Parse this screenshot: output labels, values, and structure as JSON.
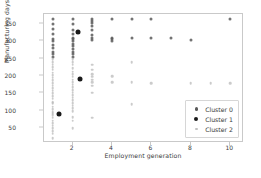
{
  "chart_data": {
    "type": "scatter",
    "title": "",
    "xlabel": "Employment generation",
    "ylabel": "Manufacturing days",
    "xlim": [
      0.55,
      10.7
    ],
    "ylim": [
      8,
      378
    ],
    "xticks": [
      2,
      4,
      6,
      8,
      10
    ],
    "yticks": [
      50,
      100,
      150,
      200,
      250,
      300,
      350
    ],
    "grid": false,
    "legend_position": "lower right",
    "legend_entries": [
      "Cluster 0",
      "Cluster 1",
      "Cluster 2"
    ],
    "series": [
      {
        "name": "Cluster 0",
        "color": "#5a5a5a",
        "marker_size": 3.0,
        "points": [
          [
            1,
            365
          ],
          [
            1,
            350
          ],
          [
            1,
            335
          ],
          [
            1,
            320
          ],
          [
            1,
            305
          ],
          [
            1,
            300
          ],
          [
            1,
            290
          ],
          [
            1,
            280
          ],
          [
            1,
            270
          ],
          [
            1,
            262
          ],
          [
            1,
            255
          ],
          [
            2,
            365
          ],
          [
            2,
            350
          ],
          [
            2,
            333
          ],
          [
            2,
            320
          ],
          [
            2,
            310
          ],
          [
            2,
            305
          ],
          [
            2,
            300
          ],
          [
            2,
            292
          ],
          [
            2,
            285
          ],
          [
            2,
            278
          ],
          [
            2,
            270
          ],
          [
            2,
            262
          ],
          [
            2,
            255
          ],
          [
            3,
            365
          ],
          [
            3,
            358
          ],
          [
            3,
            352
          ],
          [
            3,
            345
          ],
          [
            3,
            332
          ],
          [
            3,
            318
          ],
          [
            3,
            308
          ],
          [
            3,
            302
          ],
          [
            4,
            365
          ],
          [
            4,
            310
          ],
          [
            4,
            305
          ],
          [
            4,
            300
          ],
          [
            5,
            365
          ],
          [
            5,
            308
          ],
          [
            6,
            365
          ],
          [
            6,
            308
          ],
          [
            7,
            308
          ],
          [
            8,
            302
          ],
          [
            10,
            365
          ]
        ]
      },
      {
        "name": "Cluster 1",
        "color": "#1a1a1a",
        "marker_size": 5.0,
        "points": [
          [
            1.3,
            92
          ],
          [
            2.3,
            325
          ],
          [
            2.4,
            193
          ]
        ]
      },
      {
        "name": "Cluster 2",
        "color": "#b9b9b9",
        "marker_size": 2.6,
        "points": [
          [
            1,
            248
          ],
          [
            1,
            240
          ],
          [
            1,
            232
          ],
          [
            1,
            225
          ],
          [
            1,
            218
          ],
          [
            1,
            210
          ],
          [
            1,
            202
          ],
          [
            1,
            195
          ],
          [
            1,
            188
          ],
          [
            1,
            180
          ],
          [
            1,
            172
          ],
          [
            1,
            165
          ],
          [
            1,
            158
          ],
          [
            1,
            150
          ],
          [
            1,
            142
          ],
          [
            1,
            135
          ],
          [
            1,
            125
          ],
          [
            1,
            122
          ],
          [
            1,
            112
          ],
          [
            1,
            105
          ],
          [
            1,
            98
          ],
          [
            1,
            95
          ],
          [
            1,
            92
          ],
          [
            1,
            88
          ],
          [
            1,
            80
          ],
          [
            1,
            72
          ],
          [
            1,
            65
          ],
          [
            1,
            58
          ],
          [
            1,
            50
          ],
          [
            1,
            42
          ],
          [
            1,
            35
          ],
          [
            1,
            22
          ],
          [
            2,
            248
          ],
          [
            2,
            240
          ],
          [
            2,
            232
          ],
          [
            2,
            222
          ],
          [
            2,
            212
          ],
          [
            2,
            205
          ],
          [
            2,
            198
          ],
          [
            2,
            190
          ],
          [
            2,
            182
          ],
          [
            2,
            175
          ],
          [
            2,
            168
          ],
          [
            2,
            160
          ],
          [
            2,
            152
          ],
          [
            2,
            145
          ],
          [
            2,
            138
          ],
          [
            2,
            130
          ],
          [
            2,
            122
          ],
          [
            2,
            115
          ],
          [
            2,
            108
          ],
          [
            2,
            100
          ],
          [
            2,
            82
          ],
          [
            2,
            72
          ],
          [
            2,
            50
          ],
          [
            3,
            232
          ],
          [
            3,
            218
          ],
          [
            3,
            205
          ],
          [
            3,
            198
          ],
          [
            3,
            190
          ],
          [
            3,
            182
          ],
          [
            3,
            172
          ],
          [
            3,
            152
          ],
          [
            3,
            80
          ],
          [
            4,
            200
          ],
          [
            4,
            182
          ],
          [
            5,
            240
          ],
          [
            5,
            182
          ],
          [
            5,
            120
          ],
          [
            6,
            180
          ],
          [
            8,
            180
          ],
          [
            9,
            180
          ],
          [
            10,
            180
          ]
        ]
      }
    ]
  },
  "axis": {
    "yticks": [
      "50",
      "100",
      "150",
      "200",
      "250",
      "300",
      "350"
    ],
    "xticks": [
      "2",
      "4",
      "6",
      "8",
      "10"
    ],
    "xlabel": "Employment generation",
    "ylabel": "Manufacturing days"
  },
  "legend": {
    "items": [
      {
        "label": "Cluster 0",
        "color": "#5a5a5a",
        "size": 3.0
      },
      {
        "label": "Cluster 1",
        "color": "#1a1a1a",
        "size": 4.6
      },
      {
        "label": "Cluster 2",
        "color": "#c2c2c2",
        "size": 2.6
      }
    ]
  }
}
